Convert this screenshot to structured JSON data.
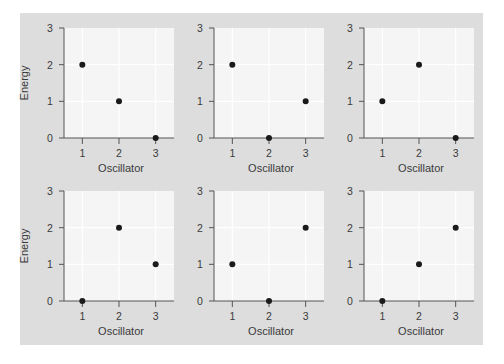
{
  "figure": {
    "background_color": "#dddddd",
    "plot_background_color": "#f5f5f5",
    "grid_color": "#ffffff",
    "point_color": "#1a1a1a",
    "axis_color": "#555555"
  },
  "chart_data": [
    {
      "type": "scatter",
      "panel": "top-left",
      "title": "",
      "xlabel": "Oscillator",
      "ylabel": "Energy",
      "x": [
        1,
        2,
        3
      ],
      "y": [
        2,
        1,
        0
      ],
      "xticks": [
        "1",
        "2",
        "3"
      ],
      "yticks": [
        "0",
        "1",
        "2",
        "3"
      ],
      "xlim": [
        0.5,
        3.5
      ],
      "ylim": [
        0,
        3
      ],
      "grid": true
    },
    {
      "type": "scatter",
      "panel": "top-middle",
      "title": "",
      "xlabel": "Oscillator",
      "ylabel": "",
      "x": [
        1,
        2,
        3
      ],
      "y": [
        2,
        0,
        1
      ],
      "xticks": [
        "1",
        "2",
        "3"
      ],
      "yticks": [
        "0",
        "1",
        "2",
        "3"
      ],
      "xlim": [
        0.5,
        3.5
      ],
      "ylim": [
        0,
        3
      ],
      "grid": true
    },
    {
      "type": "scatter",
      "panel": "top-right",
      "title": "",
      "xlabel": "Oscillator",
      "ylabel": "",
      "x": [
        1,
        2,
        3
      ],
      "y": [
        1,
        2,
        0
      ],
      "xticks": [
        "1",
        "2",
        "3"
      ],
      "yticks": [
        "0",
        "1",
        "2",
        "3"
      ],
      "xlim": [
        0.5,
        3.5
      ],
      "ylim": [
        0,
        3
      ],
      "grid": true
    },
    {
      "type": "scatter",
      "panel": "bottom-left",
      "title": "",
      "xlabel": "Oscillator",
      "ylabel": "Energy",
      "x": [
        1,
        2,
        3
      ],
      "y": [
        0,
        2,
        1
      ],
      "xticks": [
        "1",
        "2",
        "3"
      ],
      "yticks": [
        "0",
        "1",
        "2",
        "3"
      ],
      "xlim": [
        0.5,
        3.5
      ],
      "ylim": [
        0,
        3
      ],
      "grid": true
    },
    {
      "type": "scatter",
      "panel": "bottom-middle",
      "title": "",
      "xlabel": "Oscillator",
      "ylabel": "",
      "x": [
        1,
        2,
        3
      ],
      "y": [
        1,
        0,
        2
      ],
      "xticks": [
        "1",
        "2",
        "3"
      ],
      "yticks": [
        "0",
        "1",
        "2",
        "3"
      ],
      "xlim": [
        0.5,
        3.5
      ],
      "ylim": [
        0,
        3
      ],
      "grid": true
    },
    {
      "type": "scatter",
      "panel": "bottom-right",
      "title": "",
      "xlabel": "Oscillator",
      "ylabel": "",
      "x": [
        1,
        2,
        3
      ],
      "y": [
        0,
        1,
        2
      ],
      "xticks": [
        "1",
        "2",
        "3"
      ],
      "yticks": [
        "0",
        "1",
        "2",
        "3"
      ],
      "xlim": [
        0.5,
        3.5
      ],
      "ylim": [
        0,
        3
      ],
      "grid": true
    }
  ]
}
